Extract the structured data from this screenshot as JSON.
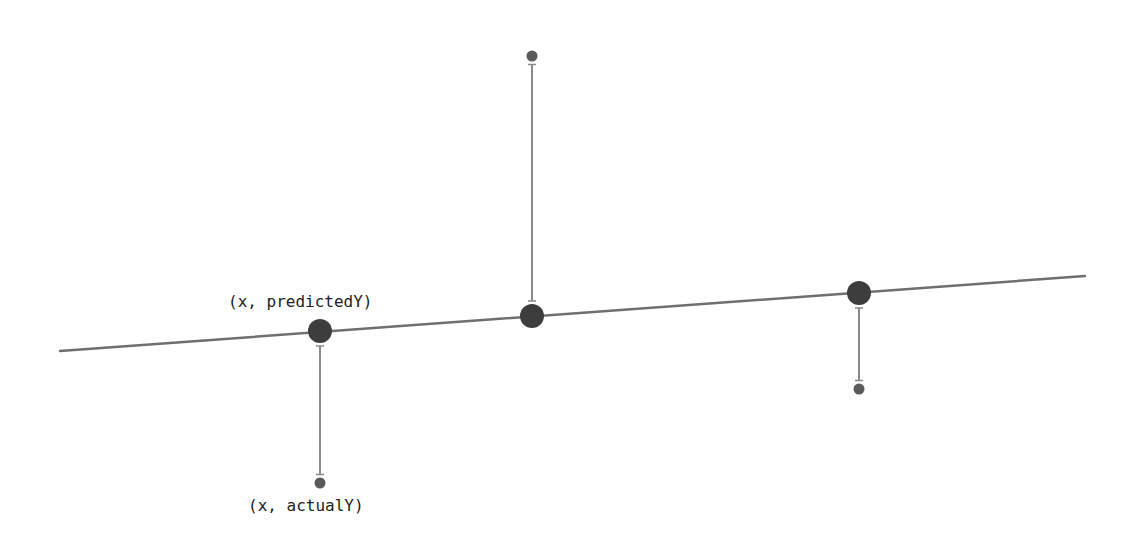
{
  "diagram": {
    "colors": {
      "line": "#6f6f6f",
      "predicted_point": "#3d3d3d",
      "actual_point": "#5a5a5a",
      "residual": "#8a8a8a",
      "text": "#222222",
      "background": "#ffffff"
    },
    "regression_line": {
      "x1": 60,
      "y1": 351,
      "x2": 1085,
      "y2": 276
    },
    "points": [
      {
        "x": 320,
        "predictedY": 331,
        "actualY": 483
      },
      {
        "x": 532,
        "predictedY": 316,
        "actualY": 56
      },
      {
        "x": 859,
        "predictedY": 293,
        "actualY": 389
      }
    ],
    "labels": {
      "predicted": {
        "text": "(x, predictedY)",
        "x": 228,
        "y": 292
      },
      "actual": {
        "text": "(x, actualY)",
        "x": 248,
        "y": 496
      }
    }
  }
}
